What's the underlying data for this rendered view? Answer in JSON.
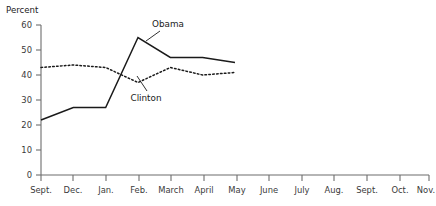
{
  "chart_data": {
    "type": "line",
    "title": "",
    "xlabel": "",
    "ylabel": "Percent",
    "ylim": [
      0,
      60
    ],
    "yticks": [
      0,
      10,
      20,
      30,
      40,
      50,
      60
    ],
    "grid": false,
    "legend_position": "inline-annotation",
    "categories": [
      "Sept.",
      "Dec.",
      "Jan.",
      "Feb.",
      "March",
      "April",
      "May",
      "June",
      "July",
      "Aug.",
      "Sept.",
      "Oct.",
      "Nov."
    ],
    "series": [
      {
        "name": "Obama",
        "style": "solid",
        "values": [
          22,
          27,
          27,
          55,
          47,
          47,
          45,
          null,
          null,
          null,
          null,
          null,
          null
        ]
      },
      {
        "name": "Clinton",
        "style": "dotted",
        "values": [
          43,
          44,
          43,
          37,
          43,
          40,
          41,
          null,
          null,
          null,
          null,
          null,
          null
        ]
      }
    ],
    "annotations": [
      {
        "label": "Obama",
        "x_px": 168,
        "y_px": 27
      },
      {
        "label": "Clinton",
        "x_px": 146,
        "y_px": 99
      }
    ]
  },
  "axis": {
    "y_title": "Percent",
    "y_tick_labels": [
      "60",
      "50",
      "40",
      "30",
      "20",
      "10",
      "0"
    ],
    "x_tick_labels": [
      "Sept.",
      "Dec.",
      "Jan.",
      "Feb.",
      "March",
      "April",
      "May",
      "June",
      "July",
      "Aug.",
      "Sept.",
      "Oct.",
      "Nov."
    ]
  },
  "colors": {
    "line": "#1a1a1a",
    "axis": "#6d6d6d",
    "text": "#3a3a3a",
    "background": "#ffffff"
  }
}
